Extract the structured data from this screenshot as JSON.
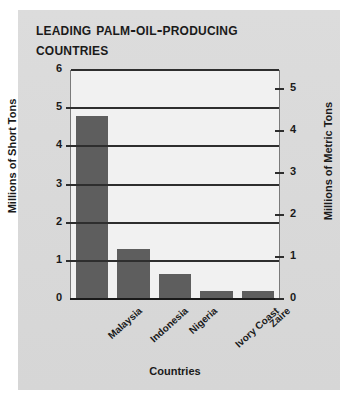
{
  "chart_data": {
    "type": "bar",
    "title": "Leading Palm-Oil-Producing Countries",
    "categories": [
      "Malaysia",
      "Indonesia",
      "Nigeria",
      "Ivory Coast",
      "Zaire"
    ],
    "values": [
      4.8,
      1.3,
      0.65,
      0.2,
      0.2
    ],
    "xlabel": "Countries",
    "ylabel": "Millions of Short Tons",
    "ylabel_right": "Millions of Metric Tons",
    "ylim": [
      0,
      6
    ],
    "ylim_right": [
      0,
      5.443
    ],
    "yticks": [
      0,
      1,
      2,
      3,
      4,
      5,
      6
    ],
    "yticks_right": [
      0,
      1,
      2,
      3,
      4,
      5
    ],
    "grid": true,
    "legend": "none",
    "bar_color": "#5e5e5e",
    "plot_background": "#f1f1f1",
    "figure_background": "#d9d9d9",
    "axis_color": "#2e2e2e",
    "text_color": "#1a1a1a"
  }
}
